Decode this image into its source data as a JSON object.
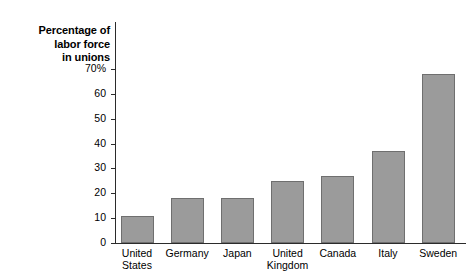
{
  "chart_data": {
    "type": "bar",
    "title": "",
    "axis_caption_lines": [
      "Percentage of",
      "labor force",
      "in unions"
    ],
    "xlabel": "",
    "ylabel": "Percentage of labor force in unions",
    "ylim": [
      0,
      72
    ],
    "grid": false,
    "legend": null,
    "categories": [
      "United States",
      "Germany",
      "Japan",
      "United Kingdom",
      "Canada",
      "Italy",
      "Sweden"
    ],
    "category_lines": [
      [
        "United",
        "States"
      ],
      [
        "Germany"
      ],
      [
        "Japan"
      ],
      [
        "United",
        "Kingdom"
      ],
      [
        "Canada"
      ],
      [
        "Italy"
      ],
      [
        "Sweden"
      ]
    ],
    "values": [
      11,
      18,
      18,
      25,
      27,
      37,
      68
    ],
    "yticks": [
      0,
      10,
      20,
      30,
      40,
      50,
      60,
      70
    ],
    "ytick_labels": [
      "0",
      "10",
      "20",
      "30",
      "40",
      "50",
      "60",
      "70%"
    ],
    "bar_color": "#9b9b9b",
    "bar_edge_color": "#6f6f6f",
    "axis_color": "#2b2b2b",
    "background_color": "#ffffff"
  }
}
